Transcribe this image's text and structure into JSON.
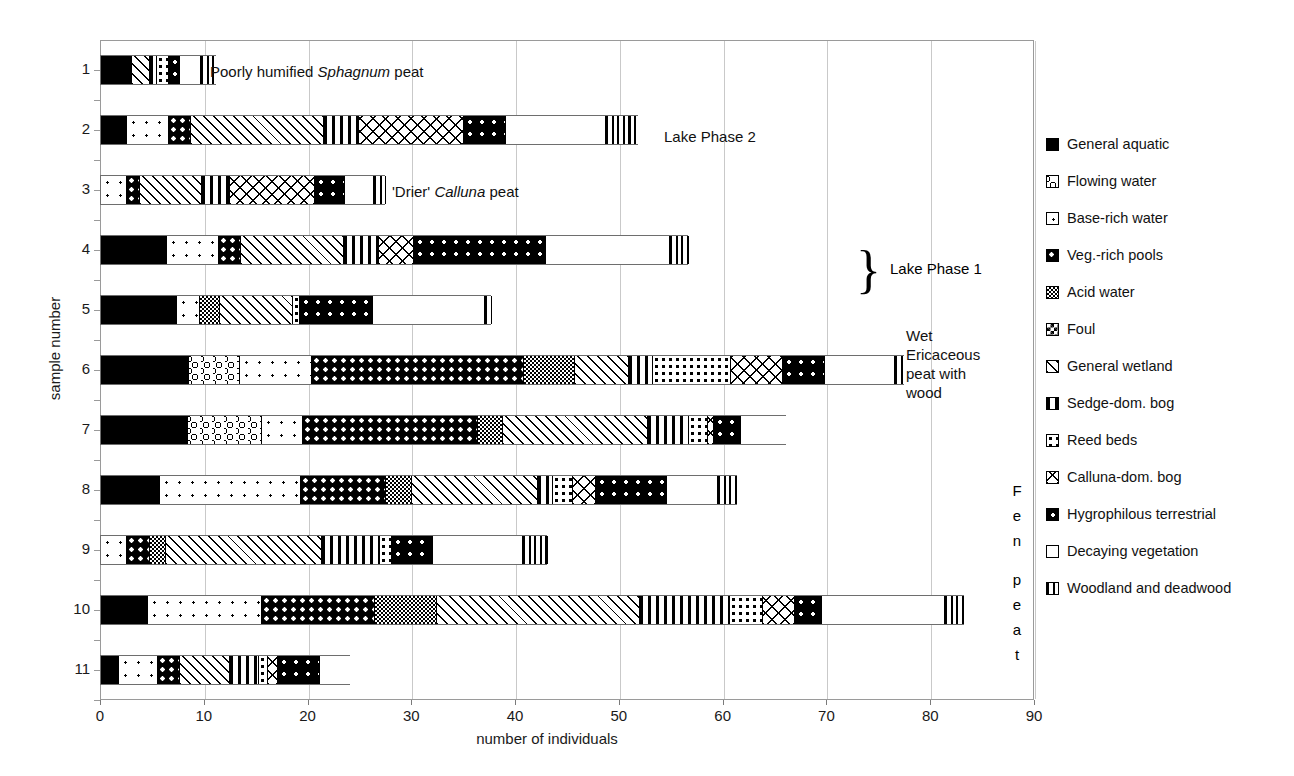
{
  "chart_data": {
    "type": "bar",
    "orientation": "horizontal",
    "stacked": true,
    "title": "",
    "xlabel": "number of individuals",
    "ylabel": "sample number",
    "xlim": [
      0,
      90
    ],
    "xticks": [
      0,
      10,
      20,
      30,
      40,
      50,
      60,
      70,
      80,
      90
    ],
    "grid": true,
    "legend_position": "right",
    "categories": [
      "1",
      "2",
      "3",
      "4",
      "5",
      "6",
      "7",
      "8",
      "9",
      "10",
      "11"
    ],
    "series": [
      {
        "name": "General aquatic",
        "key": "general-aquatic",
        "values": [
          2.9,
          2.4,
          0.0,
          6.3,
          7.2,
          8.4,
          8.3,
          5.6,
          0.0,
          4.4,
          1.6
        ]
      },
      {
        "name": "Flowing water",
        "key": "flowing-water",
        "values": [
          0.0,
          0.0,
          0.0,
          0.0,
          0.0,
          4.9,
          7.1,
          0.0,
          0.0,
          0.0,
          0.0
        ]
      },
      {
        "name": "Base-rich water",
        "key": "base-rich-water",
        "values": [
          0.0,
          4.1,
          2.4,
          5.0,
          2.2,
          6.9,
          4.0,
          13.6,
          2.4,
          11.0,
          3.8
        ]
      },
      {
        "name": "Veg.-rich pools",
        "key": "veg-rich-pools",
        "values": [
          0.0,
          2.1,
          1.3,
          2.1,
          0.0,
          20.5,
          16.8,
          8.2,
          2.2,
          10.9,
          2.1
        ]
      },
      {
        "name": "Acid water",
        "key": "acid-water",
        "values": [
          0.0,
          0.0,
          0.0,
          0.0,
          2.0,
          4.9,
          2.4,
          2.5,
          1.6,
          6.0,
          0.0
        ]
      },
      {
        "name": "Foul",
        "key": "foul",
        "values": [
          0.0,
          0.0,
          0.0,
          0.0,
          0.0,
          0.0,
          0.0,
          0.0,
          0.0,
          0.0,
          0.0
        ]
      },
      {
        "name": "General wetland",
        "key": "general-wetland",
        "values": [
          1.7,
          12.8,
          5.9,
          9.9,
          7.0,
          5.2,
          14.0,
          12.1,
          15.0,
          19.5,
          4.8
        ]
      },
      {
        "name": "Sedge-dom. bog",
        "key": "sedge-dom-bog",
        "values": [
          0.7,
          3.4,
          2.7,
          3.4,
          0.0,
          2.3,
          4.0,
          1.5,
          5.6,
          8.7,
          2.8
        ]
      },
      {
        "name": "Reed beds",
        "key": "reed-beds",
        "values": [
          1.2,
          0.0,
          0.0,
          0.0,
          0.7,
          7.5,
          1.8,
          1.9,
          1.1,
          3.2,
          0.9
        ]
      },
      {
        "name": "Calluna-dom. bog",
        "key": "calluna-dom-bog",
        "values": [
          0.0,
          10.1,
          8.2,
          3.4,
          0.0,
          5.0,
          0.6,
          2.2,
          0.0,
          3.1,
          1.0
        ]
      },
      {
        "name": "Hygrophilous terrestrial",
        "key": "hygrophilous",
        "values": [
          1.0,
          4.0,
          2.9,
          12.7,
          7.0,
          4.1,
          2.6,
          6.8,
          4.0,
          2.6,
          4.0
        ]
      },
      {
        "name": "Decaying vegetation",
        "key": "decaying-vegetation",
        "values": [
          2.0,
          9.7,
          2.8,
          11.9,
          10.8,
          6.7,
          4.5,
          5.0,
          8.7,
          11.8,
          3.1
        ]
      },
      {
        "name": "Woodland and deadwood",
        "key": "woodland",
        "values": [
          1.7,
          3.2,
          1.3,
          2.0,
          0.8,
          1.1,
          0.0,
          2.0,
          2.5,
          2.1,
          0.0
        ]
      }
    ],
    "totals": [
      11.2,
      51.8,
      27.5,
      56.7,
      37.7,
      77.5,
      66.1,
      61.4,
      43.1,
      83.3,
      24.1
    ]
  },
  "axis": {
    "x_title": "number of individuals",
    "y_title": "sample number",
    "x_ticks": [
      "0",
      "10",
      "20",
      "30",
      "40",
      "50",
      "60",
      "70",
      "80",
      "90"
    ],
    "y_ticks": [
      "1",
      "2",
      "3",
      "4",
      "5",
      "6",
      "7",
      "8",
      "9",
      "10",
      "11"
    ]
  },
  "legend": {
    "items": [
      {
        "label": "General aquatic",
        "key": "general-aquatic"
      },
      {
        "label": "Flowing water",
        "key": "flowing-water"
      },
      {
        "label": "Base-rich water",
        "key": "base-rich-water"
      },
      {
        "label": "Veg.-rich pools",
        "key": "veg-rich-pools"
      },
      {
        "label": "Acid water",
        "key": "acid-water"
      },
      {
        "label": "Foul",
        "key": "foul"
      },
      {
        "label": "General wetland",
        "key": "general-wetland"
      },
      {
        "label": "Sedge-dom. bog",
        "key": "sedge-dom-bog"
      },
      {
        "label": "Reed beds",
        "key": "reed-beds"
      },
      {
        "label": "Calluna-dom. bog",
        "key": "calluna-dom-bog"
      },
      {
        "label": "Hygrophilous terrestrial",
        "key": "hygrophilous"
      },
      {
        "label": "Decaying vegetation",
        "key": "decaying-vegetation"
      },
      {
        "label": "Woodland and deadwood",
        "key": "woodland"
      }
    ]
  },
  "annotations": {
    "poorly_humified_pre": "Poorly humified ",
    "poorly_humified_italic": "Sphagnum",
    "poorly_humified_post": " peat",
    "lake_phase_2": "Lake Phase 2",
    "drier_pre": "'Drier' ",
    "drier_italic": "Calluna",
    "drier_post": " peat",
    "lake_phase_1": "Lake Phase 1",
    "brace": "}",
    "wet_ericaceous": "Wet\nEricaceous\npeat with\nwood",
    "fen_peat": "Fen\npeat"
  },
  "colors": {
    "ink": "#000000",
    "grid": "#c9c9c9",
    "frame": "#9a9a9a",
    "paper": "#ffffff"
  }
}
